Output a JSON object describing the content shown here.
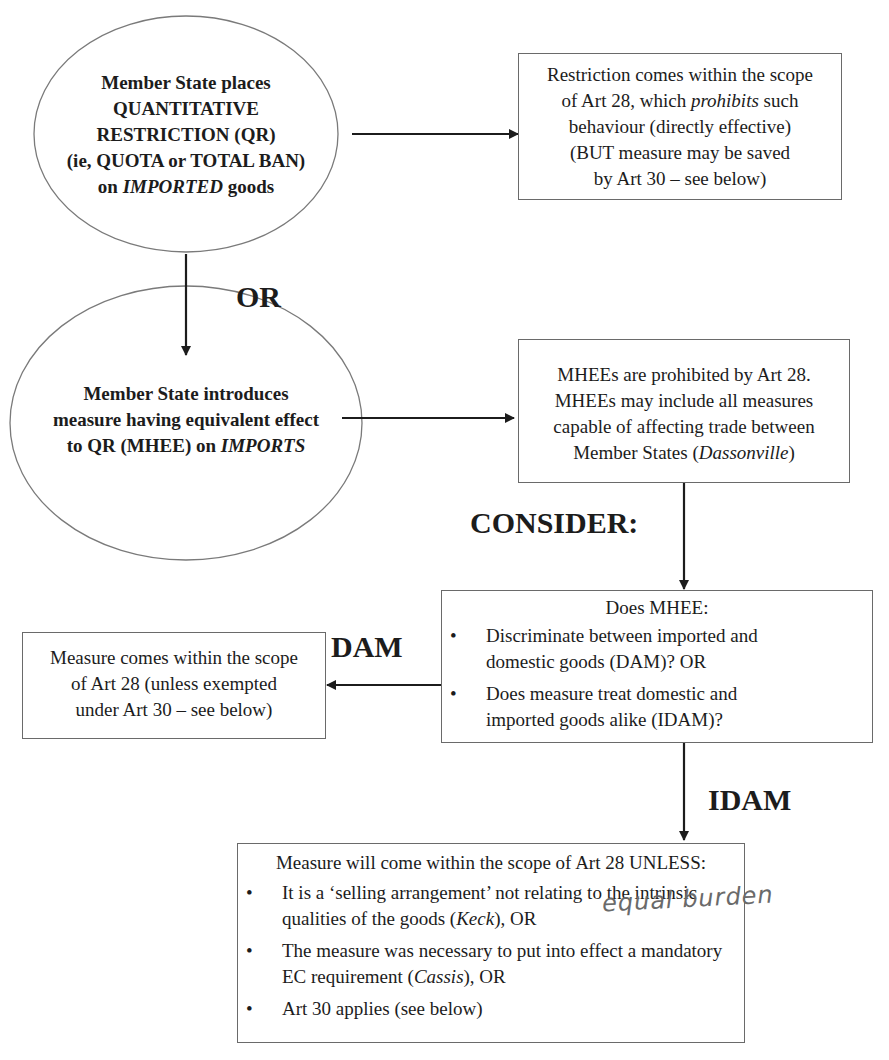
{
  "diagram": {
    "type": "flowchart",
    "nodes": {
      "qr_ellipse": {
        "shape": "ellipse",
        "lines": [
          {
            "text": "Member State places"
          },
          {
            "text": "QUANTITATIVE"
          },
          {
            "text": "RESTRICTION (QR)"
          },
          {
            "text": "(ie, QUOTA or TOTAL BAN)"
          },
          {
            "pre": "on ",
            "em": "IMPORTED",
            "post": " goods"
          }
        ]
      },
      "qr_result_box": {
        "shape": "rectangle",
        "lines": [
          {
            "text": "Restriction comes within the scope"
          },
          {
            "pre": "of Art 28, which ",
            "em": "prohibits",
            "post": " such"
          },
          {
            "text": "behaviour (directly effective)"
          },
          {
            "text": "(BUT measure may be saved"
          },
          {
            "text": "by Art 30 – see below)"
          }
        ]
      },
      "mhee_ellipse": {
        "shape": "ellipse",
        "lines": [
          {
            "text": "Member State introduces"
          },
          {
            "text": "measure having equivalent effect"
          },
          {
            "pre": "to QR (MHEE) on ",
            "em": "IMPORTS",
            "post": ""
          }
        ]
      },
      "mhee_result_box": {
        "shape": "rectangle",
        "lines": [
          {
            "text": "MHEEs are prohibited by Art 28."
          },
          {
            "text": "MHEEs may include all measures"
          },
          {
            "text": "capable of affecting trade between"
          },
          {
            "pre": "Member States (",
            "em": "Dassonville",
            "post": ")"
          }
        ]
      },
      "does_mhee_box": {
        "shape": "rectangle",
        "heading": "Does MHEE:",
        "bullets": [
          {
            "lines": [
              "Discriminate between imported and",
              "domestic goods (DAM)? OR"
            ]
          },
          {
            "lines": [
              "Does measure treat domestic and",
              "imported goods alike (IDAM)?"
            ]
          }
        ]
      },
      "dam_result_box": {
        "shape": "rectangle",
        "lines": [
          {
            "text": "Measure comes within the scope"
          },
          {
            "text": "of Art 28 (unless exempted"
          },
          {
            "text": "under Art 30 – see below)"
          }
        ]
      },
      "idam_result_box": {
        "shape": "rectangle",
        "heading": "Measure will come within the scope of Art 28 UNLESS:",
        "bullets": [
          {
            "line1": "It is a ‘selling arrangement’ not relating to the intrinsic",
            "pre": "qualities of the goods (",
            "em": "Keck",
            "post": "), OR"
          },
          {
            "line1": "The measure was necessary to put into effect a mandatory",
            "pre": "EC requirement (",
            "em": "Cassis",
            "post": "), OR"
          },
          {
            "line1": "Art 30 applies (see below)"
          }
        ]
      }
    },
    "edge_labels": {
      "or": "OR",
      "consider": "CONSIDER:",
      "dam": "DAM",
      "idam": "IDAM"
    },
    "annotation": {
      "handwritten": "equal burden"
    },
    "bullet_glyph": "•",
    "colors": {
      "line": "#1c1c1c",
      "border": "#6a6a6a",
      "text": "#1c1c1c",
      "handwriting": "#6a6a6a"
    }
  }
}
